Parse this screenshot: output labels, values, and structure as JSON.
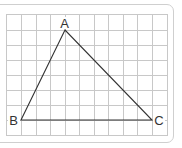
{
  "figure": {
    "type": "triangle-on-grid",
    "grid": {
      "columns": 11,
      "rows": 8,
      "line_color": "#c8c8c8"
    },
    "edge_color": "#333333",
    "frame_color": "#cfcfcf",
    "vertices": [
      {
        "label": "A",
        "grid_x": 4,
        "grid_y": 1
      },
      {
        "label": "B",
        "grid_x": 1,
        "grid_y": 7
      },
      {
        "label": "C",
        "grid_x": 10,
        "grid_y": 7
      }
    ],
    "labels": {
      "a": "A",
      "b": "B",
      "c": "C"
    }
  }
}
